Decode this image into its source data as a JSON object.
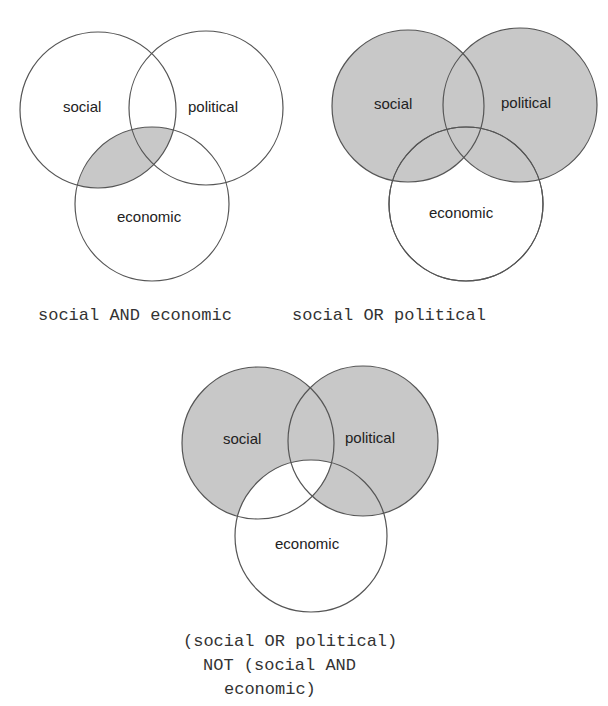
{
  "colors": {
    "shade": "#c8c8c8",
    "stroke": "#555555",
    "text": "#222222",
    "background": "#ffffff"
  },
  "diagrams": [
    {
      "id": "and",
      "caption_lines": [
        "social AND economic"
      ],
      "sets": {
        "social": {
          "label": "social",
          "cx": 98,
          "cy": 110,
          "r": 78
        },
        "political": {
          "label": "political",
          "cx": 206,
          "cy": 108,
          "r": 77
        },
        "economic": {
          "label": "economic",
          "cx": 152,
          "cy": 204,
          "r": 77
        }
      },
      "shaded_region": "social ∩ economic"
    },
    {
      "id": "or",
      "caption_lines": [
        "social OR political"
      ],
      "sets": {
        "social": {
          "label": "social",
          "cx": 408,
          "cy": 106,
          "r": 76
        },
        "political": {
          "label": "political",
          "cx": 520,
          "cy": 105,
          "r": 77
        },
        "economic": {
          "label": "economic",
          "cx": 466,
          "cy": 204,
          "r": 77
        }
      },
      "shaded_region": "social ∪ political"
    },
    {
      "id": "not",
      "caption_lines": [
        "(social OR political)",
        "NOT (social AND",
        "economic)"
      ],
      "sets": {
        "social": {
          "label": "social",
          "cx": 258,
          "cy": 443,
          "r": 76
        },
        "political": {
          "label": "political",
          "cx": 363,
          "cy": 441,
          "r": 75
        },
        "economic": {
          "label": "economic",
          "cx": 311,
          "cy": 536,
          "r": 76
        }
      },
      "shaded_region": "(social ∪ political) − (social ∩ economic)"
    }
  ]
}
